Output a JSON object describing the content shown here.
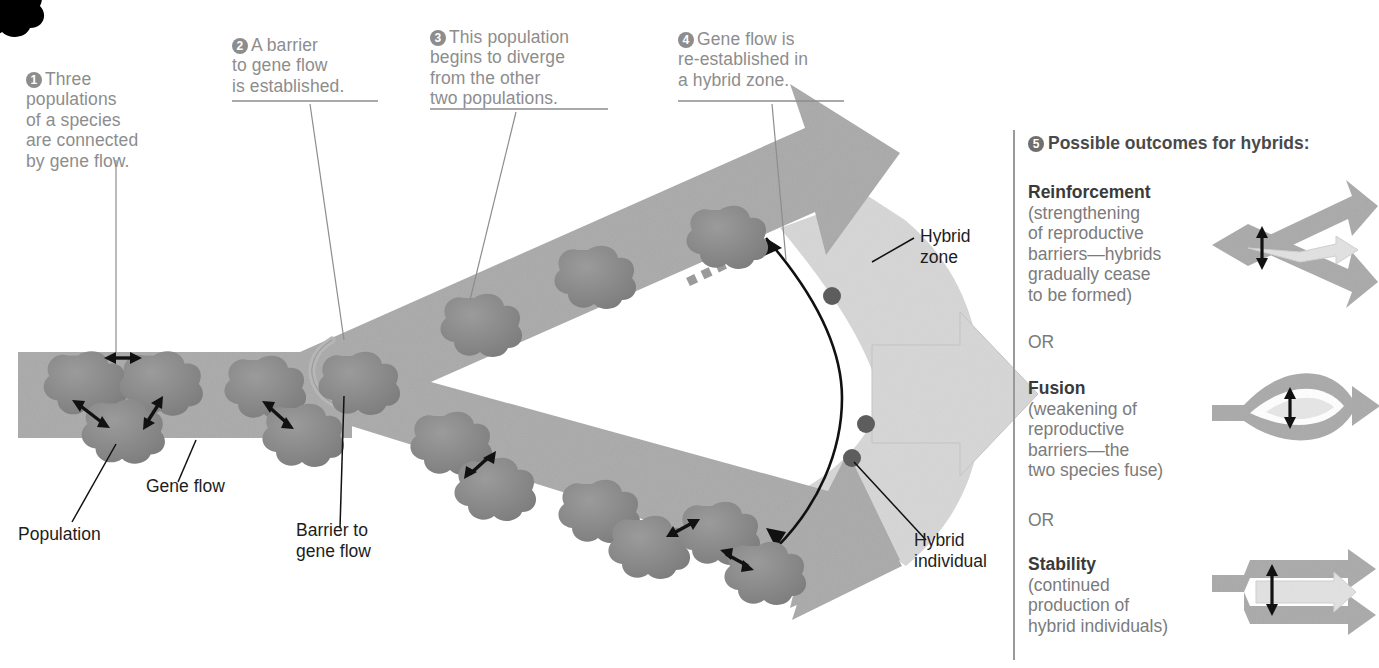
{
  "figure": {
    "colors": {
      "band": "#a9a9a9",
      "band_dark": "#9a9a9a",
      "hybrid_zone": "#d6d6d6",
      "population_blob": "#8a8a8a",
      "hybrid_individual": "#5a5a5a",
      "callout_text": "#8d8d8d",
      "label_text": "#1d1d1d",
      "barrier_line": "#111111"
    }
  },
  "callouts": [
    {
      "number": "1",
      "lead": "Three",
      "rest": "populations\nof a species\nare connected\nby gene flow."
    },
    {
      "number": "2",
      "lead": "A barrier",
      "rest": "to gene flow\nis established."
    },
    {
      "number": "3",
      "lead": "This population",
      "rest": "begins to diverge\nfrom the other\ntwo populations."
    },
    {
      "number": "4",
      "lead": "Gene flow is",
      "rest": "re-established in\na hybrid zone."
    }
  ],
  "labels": {
    "gene_flow": "Gene flow",
    "population": "Population",
    "barrier_to_gene_flow": "Barrier to\ngene flow",
    "hybrid_zone": "Hybrid\nzone",
    "hybrid_individual": "Hybrid\nindividual"
  },
  "panel": {
    "number": "5",
    "heading": "Possible outcomes for hybrids:",
    "or_1": "OR",
    "or_2": "OR",
    "outcomes": [
      {
        "name": "reinforcement",
        "title": "Reinforcement",
        "body": "(strengthening\nof reproductive\nbarriers—hybrids\ngradually cease\nto be formed)"
      },
      {
        "name": "fusion",
        "title": "Fusion",
        "body": "(weakening of\nreproductive\nbarriers—the\ntwo species fuse)"
      },
      {
        "name": "stability",
        "title": "Stability",
        "body": "(continued\nproduction of\nhybrid individuals)"
      }
    ]
  }
}
